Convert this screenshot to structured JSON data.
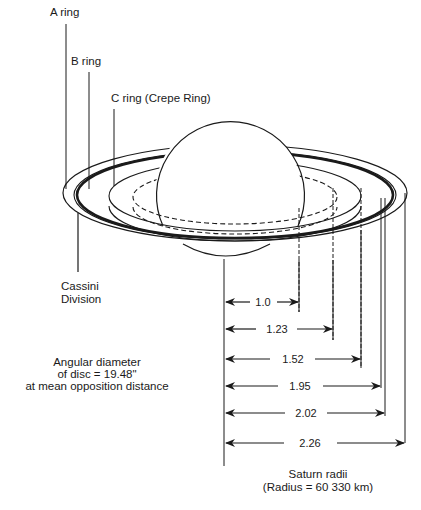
{
  "diagram": {
    "ring_labels": [
      {
        "id": "a",
        "text": "A ring"
      },
      {
        "id": "b",
        "text": "B ring"
      },
      {
        "id": "c",
        "text": "C ring (Crepe Ring)"
      }
    ],
    "cassini": {
      "line1": "Cassini",
      "line2": "Division"
    },
    "angular": {
      "line1": "Angular diameter",
      "line2": "of disc = 19.48\"",
      "line3": "at mean opposition distance"
    },
    "radii": [
      {
        "value": "1.0"
      },
      {
        "value": "1.23"
      },
      {
        "value": "1.52"
      },
      {
        "value": "1.95"
      },
      {
        "value": "2.02"
      },
      {
        "value": "2.26"
      }
    ],
    "units": {
      "line1": "Saturn radii",
      "line2": "(Radius = 60 330 km)"
    },
    "colors": {
      "ink": "#1a1a1a",
      "background": "#ffffff"
    }
  }
}
